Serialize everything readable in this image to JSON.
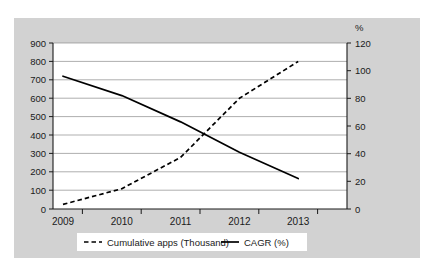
{
  "chart_data": {
    "type": "line",
    "title": "",
    "xlabel": "",
    "ylabel": "",
    "categories": [
      "2009",
      "2010",
      "2011",
      "2012",
      "2013"
    ],
    "x": [
      2009,
      2010,
      2011,
      2012,
      2013
    ],
    "grid": true,
    "legend_position": "bottom",
    "y_left": {
      "label": "",
      "ticks": [
        0,
        100,
        200,
        300,
        400,
        500,
        600,
        700,
        800,
        900
      ],
      "tick_labels": [
        "0",
        "100",
        "200",
        "300",
        "400",
        "500",
        "600",
        "700",
        "800",
        "900"
      ],
      "ylim": [
        0,
        900
      ]
    },
    "y_right": {
      "label": "%",
      "ticks": [
        0,
        20,
        40,
        60,
        80,
        100,
        120
      ],
      "tick_labels": [
        "0",
        "20",
        "40",
        "60",
        "80",
        "100",
        "120"
      ],
      "ylim": [
        0,
        120
      ]
    },
    "series": [
      {
        "name": "Cumulative apps (Thousand)",
        "style": "dashed",
        "axis": "left",
        "values": [
          25,
          110,
          280,
          600,
          800
        ]
      },
      {
        "name": "CAGR (%)",
        "style": "solid",
        "axis": "right",
        "values": [
          96,
          82,
          63,
          41,
          22
        ]
      }
    ],
    "legend": [
      {
        "label": "Cumulative apps (Thousand)",
        "style": "dashed"
      },
      {
        "label": "CAGR (%)",
        "style": "solid"
      }
    ],
    "colors": {
      "panel_background": "#d2d2d2",
      "plot_background": "#ffffff",
      "gridline": "#8c8c8c",
      "axis": "#1a1a1a",
      "series": "#000000"
    }
  }
}
